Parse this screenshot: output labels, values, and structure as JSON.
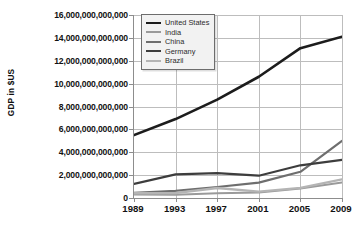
{
  "chart_data": {
    "type": "line",
    "title": "",
    "xlabel": "",
    "ylabel": "GDP in $US",
    "x": [
      1989,
      1993,
      1997,
      2001,
      2005,
      2009
    ],
    "xlim": [
      1989,
      2009
    ],
    "ylim": [
      0,
      16000000000000
    ],
    "grid": true,
    "legend_position": "top-left-inside",
    "xticklabels": [
      "1989",
      "1993",
      "1997",
      "2001",
      "2005",
      "2009"
    ],
    "yticklabels": [
      "0",
      "2,000,000,000,000",
      "4,000,000,000,000",
      "6,000,000,000,000",
      "8,000,000,000,000",
      "10,000,000,000,000",
      "12,000,000,000,000",
      "14,000,000,000,000",
      "16,000,000,000,000"
    ],
    "ytickvalues": [
      0,
      2000000000000,
      4000000000000,
      6000000000000,
      8000000000000,
      10000000000000,
      12000000000000,
      14000000000000,
      16000000000000
    ],
    "series": [
      {
        "name": "United States",
        "color": "#1c1c1c",
        "width": 2.6,
        "values": [
          5500000000000,
          6900000000000,
          8600000000000,
          10600000000000,
          13100000000000,
          14100000000000
        ]
      },
      {
        "name": "India",
        "color": "#9a9a9a",
        "width": 2.0,
        "values": [
          300000000000,
          280000000000,
          420000000000,
          490000000000,
          830000000000,
          1350000000000
        ]
      },
      {
        "name": "China",
        "color": "#6e6e6e",
        "width": 2.2,
        "values": [
          460000000000,
          620000000000,
          960000000000,
          1340000000000,
          2290000000000,
          5000000000000
        ]
      },
      {
        "name": "Germany",
        "color": "#3d3d3d",
        "width": 2.2,
        "values": [
          1230000000000,
          2070000000000,
          2180000000000,
          1950000000000,
          2860000000000,
          3340000000000
        ]
      },
      {
        "name": "Brazil",
        "color": "#b4b4b4",
        "width": 2.4,
        "values": [
          420000000000,
          440000000000,
          880000000000,
          560000000000,
          890000000000,
          1630000000000
        ]
      }
    ]
  },
  "legend": {
    "items": [
      {
        "label": "United States"
      },
      {
        "label": "India"
      },
      {
        "label": "China"
      },
      {
        "label": "Germany"
      },
      {
        "label": "Brazil"
      }
    ]
  }
}
